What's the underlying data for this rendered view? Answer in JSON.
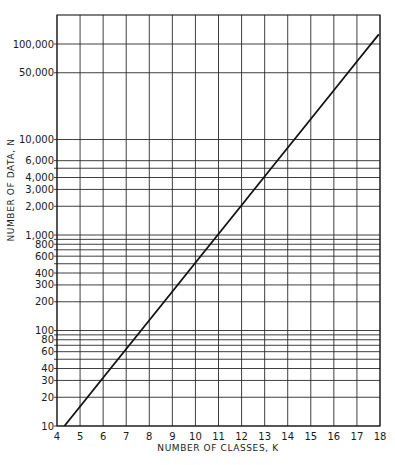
{
  "chart_data": {
    "type": "line",
    "title": "",
    "xlabel": "NUMBER OF CLASSES, K",
    "ylabel": "NUMBER OF DATA, N",
    "x_scale": "linear",
    "y_scale": "log",
    "xlim": [
      4,
      18
    ],
    "ylim": [
      10,
      200000
    ],
    "grid": true,
    "legend": null,
    "x_ticks": [
      4,
      5,
      6,
      7,
      8,
      9,
      10,
      11,
      12,
      13,
      14,
      15,
      16,
      17,
      18
    ],
    "x_tick_labels": [
      "4",
      "5",
      "6",
      "7",
      "8",
      "9",
      "10",
      "11",
      "12",
      "13",
      "14",
      "15",
      "16",
      "17",
      "18"
    ],
    "y_gridlines": [
      10,
      20,
      30,
      40,
      50,
      60,
      70,
      80,
      90,
      100,
      200,
      300,
      400,
      500,
      600,
      700,
      800,
      900,
      1000,
      2000,
      3000,
      4000,
      5000,
      6000,
      10000,
      50000,
      100000
    ],
    "y_tick_labels": [
      {
        "value": 10,
        "label": "10"
      },
      {
        "value": 20,
        "label": "20"
      },
      {
        "value": 30,
        "label": "30"
      },
      {
        "value": 40,
        "label": "40"
      },
      {
        "value": 60,
        "label": "60"
      },
      {
        "value": 80,
        "label": "80"
      },
      {
        "value": 100,
        "label": "100"
      },
      {
        "value": 200,
        "label": "200"
      },
      {
        "value": 300,
        "label": "300"
      },
      {
        "value": 400,
        "label": "400"
      },
      {
        "value": 600,
        "label": "600"
      },
      {
        "value": 800,
        "label": "800"
      },
      {
        "value": 1000,
        "label": "1,000"
      },
      {
        "value": 2000,
        "label": "2,000"
      },
      {
        "value": 3000,
        "label": "3,000"
      },
      {
        "value": 4000,
        "label": "4,000"
      },
      {
        "value": 6000,
        "label": "6,000"
      },
      {
        "value": 10000,
        "label": "10,000"
      },
      {
        "value": 50000,
        "label": "50,000"
      },
      {
        "value": 100000,
        "label": "100,000"
      }
    ],
    "series": [
      {
        "name": "N vs K",
        "x": [
          4.32,
          5,
          6,
          7,
          8,
          9,
          10,
          11,
          12,
          13,
          14,
          15,
          16,
          17,
          17.95
        ],
        "y": [
          10,
          16,
          32,
          64,
          128,
          256,
          512,
          1024,
          2048,
          4096,
          8192,
          16384,
          32768,
          65536,
          126000
        ]
      }
    ]
  }
}
